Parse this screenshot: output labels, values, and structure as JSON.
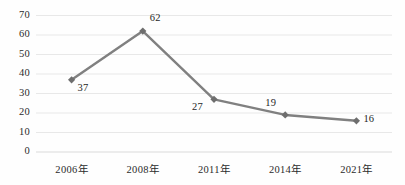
{
  "chart_data": {
    "type": "line",
    "title": "",
    "subtitle": "",
    "xlabel": "",
    "ylabel": "",
    "categories": [
      "2006年",
      "2008年",
      "2011年",
      "2014年",
      "2021年"
    ],
    "values": [
      37,
      62,
      27,
      19,
      16
    ],
    "point_labels": [
      "37",
      "62",
      "27",
      "19",
      "16"
    ],
    "series": [
      {
        "name": "",
        "values": [
          37,
          62,
          27,
          19,
          16
        ]
      }
    ],
    "ylim": [
      0,
      70
    ],
    "ytick_step": 10,
    "yticks": [
      0,
      10,
      20,
      30,
      40,
      50,
      60,
      70
    ],
    "ytick_labels": [
      "0",
      "10",
      "20",
      "30",
      "40",
      "50",
      "60",
      "70"
    ],
    "grid": true,
    "grid_axis": "y",
    "legend": false,
    "legend_position": "none",
    "marker": "diamond",
    "line_color": "#808080",
    "marker_color": "#6e6e6e",
    "grid_color": "#e8e8e8",
    "axis_color": "#d9d9d9",
    "text_color": "#2b2b2b",
    "background_color": "#fefefe",
    "label_offsets": [
      {
        "value": "37",
        "position": "below-right"
      },
      {
        "value": "62",
        "position": "above-right"
      },
      {
        "value": "27",
        "position": "below-left"
      },
      {
        "value": "19",
        "position": "above-left"
      },
      {
        "value": "16",
        "position": "right"
      }
    ]
  }
}
